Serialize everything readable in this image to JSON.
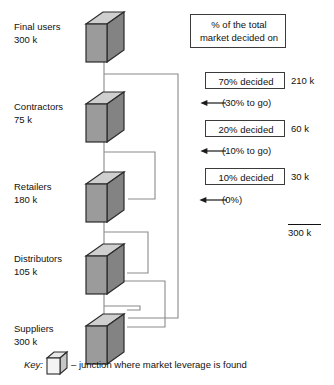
{
  "diagram": {
    "title_box": {
      "line1": "% of the total",
      "line2": "market decided on"
    },
    "chain": [
      {
        "label": "Final users",
        "value": "300 k"
      },
      {
        "label": "Contractors",
        "value": "75 k"
      },
      {
        "label": "Retailers",
        "value": "180 k"
      },
      {
        "label": "Distributors",
        "value": "105 k"
      },
      {
        "label": "Suppliers",
        "value": "300 k"
      }
    ],
    "steps": [
      {
        "box": "70% decided",
        "amount": "210 k",
        "transition": "(30% to go)"
      },
      {
        "box": "20% decided",
        "amount": "60 k",
        "transition": "(10% to go)"
      },
      {
        "box": "10% decided",
        "amount": "30 k",
        "transition": "(0%)"
      }
    ],
    "total": "300 k",
    "key": {
      "label": "Key:",
      "icon": "cube-icon",
      "description": "– junction where market leverage is found"
    },
    "colors": {
      "cube_front": "#9b9b9b",
      "cube_top": "#cfcfcf",
      "cube_side": "#838383",
      "cube_outline": "#2b2b2b",
      "connector": "#8a8a8a",
      "box_border": "#3b3b3b",
      "arrow": "#1a1a1a"
    }
  }
}
